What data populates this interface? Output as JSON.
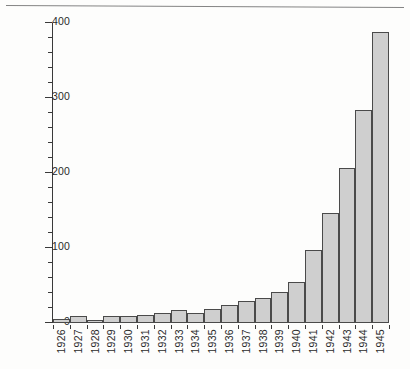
{
  "chart_data": {
    "type": "bar",
    "title": "",
    "subtitle": "",
    "xlabel": "",
    "ylabel": "",
    "categories": [
      "1926",
      "1927",
      "1928",
      "1929",
      "1930",
      "1931",
      "1932",
      "1933",
      "1934",
      "1935",
      "1936",
      "1937",
      "1938",
      "1939",
      "1940",
      "1941",
      "1942",
      "1943",
      "1944",
      "1945"
    ],
    "values": [
      5,
      9,
      4,
      9,
      9,
      11,
      14,
      18,
      14,
      19,
      24,
      29,
      33,
      42,
      55,
      98,
      147,
      207,
      284,
      388
    ],
    "ylim": [
      0,
      400
    ],
    "ytick_labels": [
      "0",
      "100",
      "200",
      "300",
      "400"
    ],
    "ytick_values": [
      0,
      100,
      200,
      300,
      400
    ],
    "yminor_step": 20,
    "grid": false,
    "legend": null,
    "legend_position": "none",
    "bar_fill_color": "#cfcfcf",
    "bar_edge_color": "#4a4a4a",
    "axis_color": "#3a3a3a"
  },
  "figure": {
    "background_color": "#fdfdfc",
    "has_top_rule": true
  }
}
